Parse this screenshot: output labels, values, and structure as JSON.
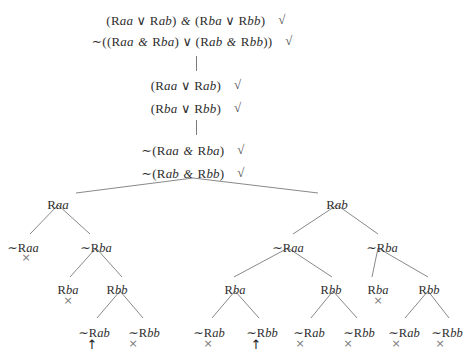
{
  "document": {
    "kind": "semantic-tableau",
    "title": "Truth tree / semantic tableau for quantified relational formulas",
    "symbols": {
      "negation": "∼",
      "disjunction": "∨",
      "conjunction": "&",
      "check": "√",
      "open_branch": "↑",
      "closed_branch": "×"
    },
    "ink_color": "#2e2e2e",
    "line_color": "#7a7a7a",
    "marker_color": "#7b7b7b"
  },
  "clipped_top_line": "",
  "formulas": [
    {
      "id": "f1",
      "text": "(Raa ∨ Rab) & (Rba ∨ Rbb)",
      "check": "√",
      "x": 196,
      "y": 13
    },
    {
      "id": "f2",
      "text": "∼((Raa & Rba) ∨ (Rab & Rbb))",
      "check": "√",
      "x": 192,
      "y": 34
    },
    {
      "id": "f3",
      "text": "(Raa ∨ Rab)",
      "check": "√",
      "x": 196,
      "y": 78
    },
    {
      "id": "f4",
      "text": "(Rba ∨ Rbb)",
      "check": "√",
      "x": 196,
      "y": 101
    },
    {
      "id": "f5",
      "text": "∼(Raa & Rba)",
      "check": "√",
      "x": 193,
      "y": 143
    },
    {
      "id": "f6",
      "text": "∼(Rab & Rbb)",
      "check": "√",
      "x": 193,
      "y": 166
    }
  ],
  "connectors": [
    {
      "id": "c1",
      "x": 196,
      "y": 56,
      "height": 15
    },
    {
      "id": "c2",
      "x": 196,
      "y": 120,
      "height": 15
    }
  ],
  "tree": {
    "levels": [
      {
        "level": 1,
        "nodes": [
          {
            "id": "n-l1-a",
            "label": "Raa",
            "x": 58,
            "y": 197
          },
          {
            "id": "n-l1-b",
            "label": "Rab",
            "x": 337,
            "y": 197
          }
        ]
      },
      {
        "level": 2,
        "nodes": [
          {
            "id": "n-l2-a",
            "label": "∼Raa",
            "x": 23,
            "y": 240
          },
          {
            "id": "n-l2-b",
            "label": "∼Rba",
            "x": 96,
            "y": 240
          },
          {
            "id": "n-l2-c",
            "label": "∼Raa",
            "x": 288,
            "y": 240
          },
          {
            "id": "n-l2-d",
            "label": "∼Rba",
            "x": 382,
            "y": 240
          }
        ]
      },
      {
        "level": 3,
        "nodes": [
          {
            "id": "n-l3-a",
            "label": "Rba",
            "x": 68,
            "y": 283
          },
          {
            "id": "n-l3-b",
            "label": "Rbb",
            "x": 117,
            "y": 283
          },
          {
            "id": "n-l3-c",
            "label": "Rba",
            "x": 235,
            "y": 283
          },
          {
            "id": "n-l3-d",
            "label": "Rbb",
            "x": 331,
            "y": 283
          },
          {
            "id": "n-l3-e",
            "label": "Rba",
            "x": 378,
            "y": 283
          },
          {
            "id": "n-l3-f",
            "label": "Rbb",
            "x": 429,
            "y": 283
          }
        ]
      },
      {
        "level": 4,
        "nodes": [
          {
            "id": "n-l4-a",
            "label": "∼Rab",
            "x": 94,
            "y": 325
          },
          {
            "id": "n-l4-b",
            "label": "∼Rbb",
            "x": 144,
            "y": 325
          },
          {
            "id": "n-l4-c",
            "label": "∼Rab",
            "x": 209,
            "y": 325
          },
          {
            "id": "n-l4-d",
            "label": "∼Rbb",
            "x": 262,
            "y": 325
          },
          {
            "id": "n-l4-e",
            "label": "∼Rab",
            "x": 309,
            "y": 325
          },
          {
            "id": "n-l4-f",
            "label": "∼Rbb",
            "x": 359,
            "y": 325
          },
          {
            "id": "n-l4-g",
            "label": "∼Rab",
            "x": 404,
            "y": 325
          },
          {
            "id": "n-l4-h",
            "label": "∼Rbb",
            "x": 447,
            "y": 325
          }
        ]
      }
    ],
    "edges": [
      {
        "id": "e-root-l",
        "x1": 193,
        "y1": 178,
        "x2": 76,
        "y2": 193
      },
      {
        "id": "e-root-r",
        "x1": 193,
        "y1": 178,
        "x2": 318,
        "y2": 193
      },
      {
        "id": "e-a-l",
        "x1": 58,
        "y1": 205,
        "x2": 30,
        "y2": 234
      },
      {
        "id": "e-a-r",
        "x1": 58,
        "y1": 205,
        "x2": 90,
        "y2": 234
      },
      {
        "id": "e-b-l",
        "x1": 96,
        "y1": 248,
        "x2": 70,
        "y2": 277
      },
      {
        "id": "e-b-r",
        "x1": 96,
        "y1": 248,
        "x2": 122,
        "y2": 277
      },
      {
        "id": "e-c-l",
        "x1": 120,
        "y1": 291,
        "x2": 97,
        "y2": 318
      },
      {
        "id": "e-c-r",
        "x1": 120,
        "y1": 291,
        "x2": 143,
        "y2": 318
      },
      {
        "id": "e-rab-l",
        "x1": 337,
        "y1": 205,
        "x2": 293,
        "y2": 234
      },
      {
        "id": "e-rab-r",
        "x1": 337,
        "y1": 205,
        "x2": 378,
        "y2": 234
      },
      {
        "id": "e-nraa-l",
        "x1": 288,
        "y1": 248,
        "x2": 234,
        "y2": 277
      },
      {
        "id": "e-nraa-r",
        "x1": 288,
        "y1": 248,
        "x2": 332,
        "y2": 277
      },
      {
        "id": "e-nrba-l",
        "x1": 378,
        "y1": 248,
        "x2": 372,
        "y2": 277
      },
      {
        "id": "e-nrba-r",
        "x1": 378,
        "y1": 248,
        "x2": 428,
        "y2": 277
      },
      {
        "id": "e-rba3-l",
        "x1": 235,
        "y1": 291,
        "x2": 212,
        "y2": 318
      },
      {
        "id": "e-rba3-r",
        "x1": 235,
        "y1": 291,
        "x2": 259,
        "y2": 318
      },
      {
        "id": "e-rbb3-l",
        "x1": 333,
        "y1": 291,
        "x2": 311,
        "y2": 318
      },
      {
        "id": "e-rbb3-r",
        "x1": 333,
        "y1": 291,
        "x2": 357,
        "y2": 318
      },
      {
        "id": "e-rbb6-l",
        "x1": 428,
        "y1": 291,
        "x2": 405,
        "y2": 318
      },
      {
        "id": "e-rbb6-r",
        "x1": 428,
        "y1": 291,
        "x2": 449,
        "y2": 318
      }
    ],
    "markers": [
      {
        "id": "m1",
        "type": "closed",
        "glyph": "×",
        "x": 26,
        "y": 252
      },
      {
        "id": "m2",
        "type": "closed",
        "glyph": "×",
        "x": 68,
        "y": 295
      },
      {
        "id": "m3",
        "type": "open",
        "glyph": "↑",
        "x": 92,
        "y": 338
      },
      {
        "id": "m4",
        "type": "closed",
        "glyph": "×",
        "x": 133,
        "y": 338
      },
      {
        "id": "m5",
        "type": "closed",
        "glyph": "×",
        "x": 208,
        "y": 338
      },
      {
        "id": "m6",
        "type": "open",
        "glyph": "↑",
        "x": 256,
        "y": 338
      },
      {
        "id": "m7",
        "type": "closed",
        "glyph": "×",
        "x": 300,
        "y": 338
      },
      {
        "id": "m8",
        "type": "closed",
        "glyph": "×",
        "x": 348,
        "y": 338
      },
      {
        "id": "m9",
        "type": "closed",
        "glyph": "×",
        "x": 378,
        "y": 295
      },
      {
        "id": "m10",
        "type": "closed",
        "glyph": "×",
        "x": 396,
        "y": 338
      },
      {
        "id": "m11",
        "type": "closed",
        "glyph": "×",
        "x": 440,
        "y": 338
      }
    ]
  }
}
